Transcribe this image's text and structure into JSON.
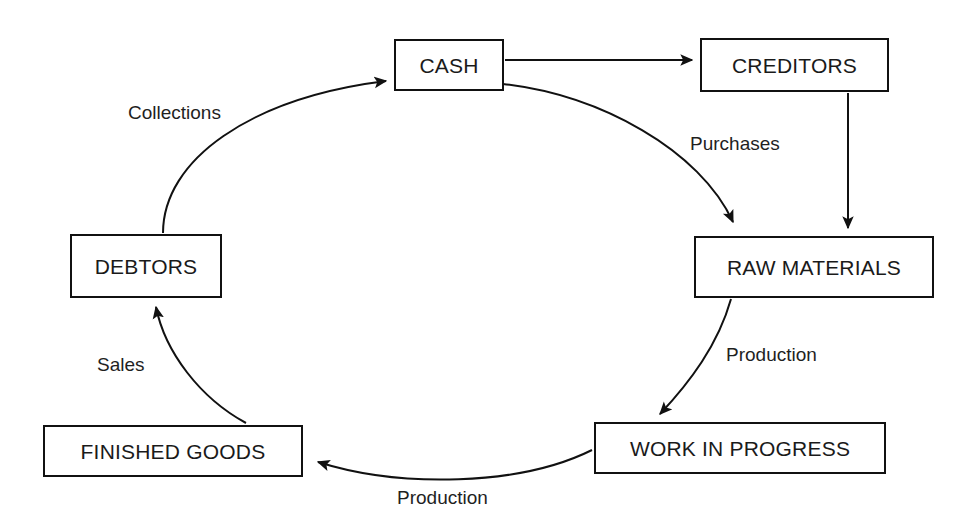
{
  "diagram": {
    "type": "cycle-flowchart",
    "background_color": "#ffffff",
    "line_color": "#111111",
    "text_color": "#1a1a1a",
    "nodes": [
      {
        "id": "cash",
        "label": "CASH",
        "x": 394,
        "y": 39,
        "w": 110,
        "h": 52
      },
      {
        "id": "creditors",
        "label": "CREDITORS",
        "x": 700,
        "y": 38,
        "w": 189,
        "h": 54
      },
      {
        "id": "raw_materials",
        "label": "RAW MATERIALS",
        "x": 694,
        "y": 236,
        "w": 240,
        "h": 62
      },
      {
        "id": "work_in_progress",
        "label": "WORK IN PROGRESS",
        "x": 594,
        "y": 422,
        "w": 292,
        "h": 52
      },
      {
        "id": "finished_goods",
        "label": "FINISHED GOODS",
        "x": 43,
        "y": 425,
        "w": 260,
        "h": 52
      },
      {
        "id": "debtors",
        "label": "DEBTORS",
        "x": 70,
        "y": 234,
        "w": 152,
        "h": 64
      }
    ],
    "edges": [
      {
        "id": "collections",
        "label": "Collections",
        "from": "debtors",
        "to": "cash",
        "label_x": 128,
        "label_y": 103
      },
      {
        "id": "cash_to_creditors",
        "label": "",
        "from": "cash",
        "to": "creditors",
        "label_x": 0,
        "label_y": 0
      },
      {
        "id": "purchases",
        "label": "Purchases",
        "from": "cash",
        "to": "raw_materials",
        "label_x": 690,
        "label_y": 134
      },
      {
        "id": "creditors_supply",
        "label": "",
        "from": "creditors",
        "to": "raw_materials",
        "label_x": 0,
        "label_y": 0
      },
      {
        "id": "production_1",
        "label": "Production",
        "from": "raw_materials",
        "to": "work_in_progress",
        "label_x": 726,
        "label_y": 345
      },
      {
        "id": "production_2",
        "label": "Production",
        "from": "work_in_progress",
        "to": "finished_goods",
        "label_x": 397,
        "label_y": 488
      },
      {
        "id": "sales",
        "label": "Sales",
        "from": "finished_goods",
        "to": "debtors",
        "label_x": 97,
        "label_y": 355
      }
    ]
  }
}
